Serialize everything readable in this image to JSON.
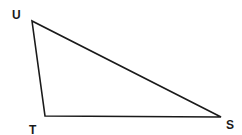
{
  "diagram": {
    "type": "triangle",
    "vertices": [
      {
        "label": "U",
        "x": 32,
        "y": 21,
        "label_x": 12,
        "label_y": 19
      },
      {
        "label": "T",
        "x": 45,
        "y": 116,
        "label_x": 29,
        "label_y": 134
      },
      {
        "label": "S",
        "x": 221,
        "y": 117,
        "label_x": 226,
        "label_y": 129
      }
    ],
    "stroke_color": "#1a1a1a",
    "background_color": "#ffffff"
  }
}
